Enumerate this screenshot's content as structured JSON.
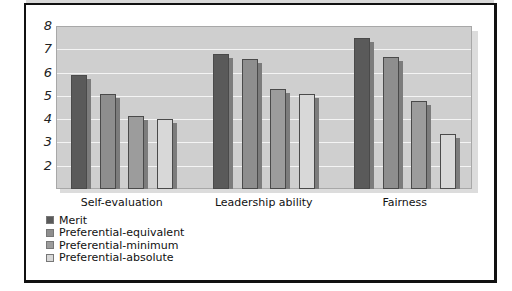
{
  "chart_data": {
    "type": "bar",
    "title": "",
    "xlabel": "",
    "ylabel": "",
    "ylim": [
      1,
      8
    ],
    "yticks": [
      2,
      3,
      4,
      5,
      6,
      7,
      8
    ],
    "grid": true,
    "legend_position": "bottom-left",
    "categories": [
      "Self-evaluation",
      "Leadership ability",
      "Fairness"
    ],
    "series": [
      {
        "name": "Merit",
        "color": "#5a5a5a",
        "values": [
          5.9,
          6.8,
          7.5
        ]
      },
      {
        "name": "Preferential-equivalent",
        "color": "#8e8e8e",
        "values": [
          5.1,
          6.6,
          6.65
        ]
      },
      {
        "name": "Preferential-minimum",
        "color": "#9c9c9c",
        "values": [
          4.15,
          5.3,
          4.8
        ]
      },
      {
        "name": "Preferential-absolute",
        "color": "#d8d8d8",
        "values": [
          4.0,
          5.1,
          3.35
        ]
      }
    ]
  },
  "legend": {
    "items": [
      {
        "label": "Merit",
        "color": "#5a5a5a"
      },
      {
        "label": "Preferential-equivalent",
        "color": "#8e8e8e"
      },
      {
        "label": "Preferential-minimum",
        "color": "#9c9c9c"
      },
      {
        "label": "Preferential-absolute",
        "color": "#d8d8d8"
      }
    ]
  }
}
